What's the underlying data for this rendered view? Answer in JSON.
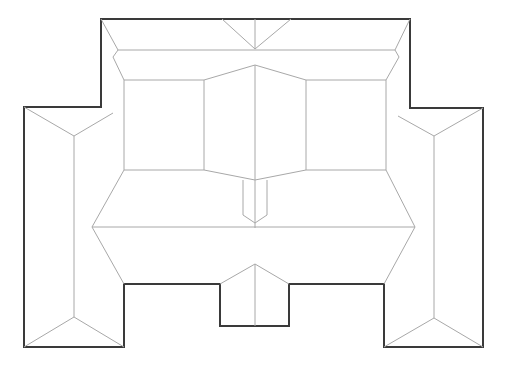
{
  "diagram": {
    "type": "roof-plan",
    "background": "#ffffff",
    "outline_color": "#3a3a3a",
    "line_color": "#a8a8a8",
    "outline_points": "101,19 410,19 410,108 483,108 483,347 384,347 384,284 289,284 289,326 220,326 220,284 124,284 124,347 24,347 24,107 101,107",
    "roof_lines": [
      "101,19 118,50 113,57 124,80",
      "410,19 395,50 399,57 386,80",
      "118,50 395,50",
      "222,19 255,49 291,19",
      "255,19 255,49",
      "124,80 204,80 255,65 306,80 386,80",
      "124,80 124,170",
      "386,80 386,170",
      "204,80 204,170",
      "306,80 306,170",
      "255,65 255,228",
      "124,170 204,170 255,180 306,170 386,170",
      "243,180 243,215 255,223 267,215 267,180",
      "124,170 92,227 124,284",
      "386,170 415,227 384,284",
      "92,227 415,227",
      "220,284 255,264 289,284",
      "255,264 255,326",
      "24,107 74,136 113,113",
      "74,136 74,317",
      "24,347 74,317 124,347",
      "483,108 434,136 398,116",
      "434,136 434,318",
      "384,347 434,318 483,347"
    ]
  }
}
